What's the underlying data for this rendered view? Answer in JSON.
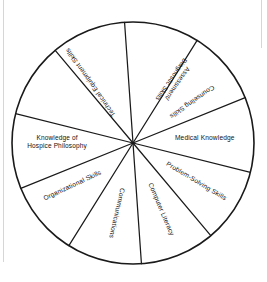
{
  "figure": {
    "type": "pie-wheel-diagram",
    "title": "",
    "segment_count": 10,
    "stroke_color": "#1a1a1a",
    "fill_color": "#ffffff"
  },
  "chart_data": {
    "type": "pie",
    "title": "",
    "xlabel": "",
    "ylabel": "",
    "legend_position": "none",
    "grid": false,
    "categories": [
      "Assessment/ Diagnostic Skills",
      "Counseling Skills",
      "Medical Knowledge",
      "Problem-Solving Skills",
      "Computer Literacy",
      "Communications",
      "Organizational Skills",
      "Knowledge of Hospice Philosophy",
      "Technical Equipment Skills"
    ],
    "values": [
      36,
      36,
      36,
      36,
      36,
      36,
      36,
      36,
      36
    ],
    "note": "Wheel divided into ten equal wedges; nine are labeled."
  },
  "segments": [
    {
      "id": "assessment-diagnostic-skills",
      "lines": [
        "Assessment/",
        "Diagnostic Skills"
      ],
      "label": "Assessment/ Diagnostic Skills",
      "rotation": -235,
      "radius": 74,
      "mid_angle": -55
    },
    {
      "id": "counseling-skills",
      "lines": [
        "Counseling Skills"
      ],
      "label": "Counseling Skills",
      "rotation": -215,
      "radius": 72,
      "mid_angle": -35
    },
    {
      "id": "medical-knowledge",
      "lines": [
        "Medical Knowledge"
      ],
      "label": "Medical Knowledge",
      "rotation": 0,
      "radius": 72,
      "mid_angle": -4
    },
    {
      "id": "problem-solving-skills",
      "lines": [
        "Problem-Solving Skills"
      ],
      "label": "Problem-Solving Skills",
      "rotation": 31,
      "radius": 74,
      "mid_angle": 31
    },
    {
      "id": "computer-literacy",
      "lines": [
        "Computer Literacy"
      ],
      "label": "Computer Literacy",
      "rotation": 67,
      "radius": 72,
      "mid_angle": 67
    },
    {
      "id": "communications",
      "lines": [
        "Communications"
      ],
      "label": "Communications",
      "rotation": 103,
      "radius": 72,
      "mid_angle": 103
    },
    {
      "id": "organizational-skills",
      "lines": [
        "Organizational Skills"
      ],
      "label": "Organizational Skills",
      "rotation": -25,
      "radius": 74,
      "mid_angle": 145
    },
    {
      "id": "knowledge-of-hospice-philosophy",
      "lines": [
        "Knowledge of",
        "Hospice Philosophy"
      ],
      "label": "Knowledge of Hospice Philosophy",
      "rotation": 0,
      "radius": 76,
      "mid_angle": 182
    },
    {
      "id": "technical-equipment-skills",
      "lines": [
        "Technical Equipment Skills"
      ],
      "label": "Technical Equipment Skills",
      "rotation": -125,
      "radius": 74,
      "mid_angle": -125
    }
  ],
  "geometry": {
    "center_x": 133,
    "center_y": 143,
    "radius": 121,
    "spoke_angles_deg": [
      -94,
      -58,
      -22,
      14,
      50,
      86,
      122,
      158,
      194,
      230
    ]
  }
}
